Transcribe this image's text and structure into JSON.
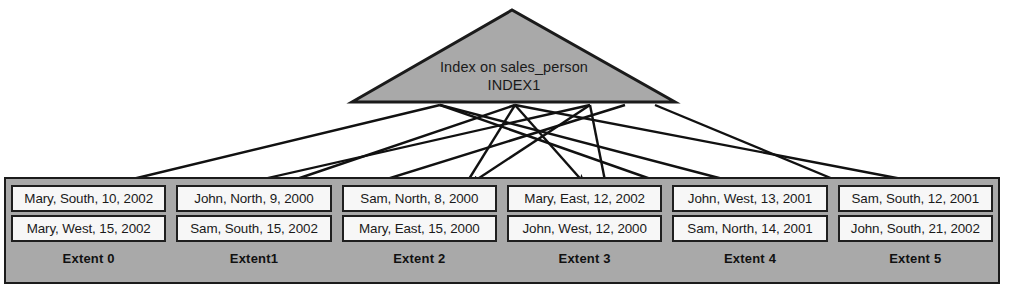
{
  "diagram": {
    "title": "Index on sales_person INDEX1",
    "index_node": {
      "shape": "triangle",
      "line1": "Index on sales_person",
      "line2": "INDEX1",
      "fill_color": "#a9a9a9",
      "stroke_color": "#1b1b1b"
    },
    "colors": {
      "extent_background": "#a9a9a9",
      "row_background": "#f7f7f7",
      "outline": "#1b1b1b",
      "page_background": "#ffffff"
    },
    "extents": [
      {
        "label": "Extent 0",
        "rows": [
          "Mary, South, 10, 2002",
          "Mary, West, 15, 2002"
        ]
      },
      {
        "label": "Extent1",
        "rows": [
          "John, North, 9, 2000",
          "Sam, South, 15, 2002"
        ]
      },
      {
        "label": "Extent 2",
        "rows": [
          "Sam, North, 8, 2000",
          "Mary, East, 15, 2000"
        ]
      },
      {
        "label": "Extent 3",
        "rows": [
          "Mary, East, 12, 2002",
          "John, West, 12, 2000"
        ]
      },
      {
        "label": "Extent 4",
        "rows": [
          "John, West, 13, 2001",
          "Sam, North, 14, 2001"
        ]
      },
      {
        "label": "Extent 5",
        "rows": [
          "Sam, South, 12, 2001",
          "John, South, 21, 2002"
        ]
      }
    ],
    "pointers": [
      {
        "from_x": 440,
        "from_y": 105,
        "to_x": 112,
        "to_y": 184
      },
      {
        "from_x": 515,
        "from_y": 105,
        "to_x": 282,
        "to_y": 184
      },
      {
        "from_x": 590,
        "from_y": 105,
        "to_x": 470,
        "to_y": 184
      },
      {
        "from_x": 515,
        "from_y": 105,
        "to_x": 585,
        "to_y": 184
      },
      {
        "from_x": 440,
        "from_y": 105,
        "to_x": 742,
        "to_y": 184
      },
      {
        "from_x": 515,
        "from_y": 105,
        "to_x": 928,
        "to_y": 184
      },
      {
        "from_x": 590,
        "from_y": 105,
        "to_x": 100,
        "to_y": 216
      },
      {
        "from_x": 625,
        "from_y": 105,
        "to_x": 268,
        "to_y": 216
      },
      {
        "from_x": 515,
        "from_y": 105,
        "to_x": 446,
        "to_y": 216
      },
      {
        "from_x": 590,
        "from_y": 105,
        "to_x": 612,
        "to_y": 216
      },
      {
        "from_x": 440,
        "from_y": 105,
        "to_x": 756,
        "to_y": 216
      },
      {
        "from_x": 655,
        "from_y": 105,
        "to_x": 922,
        "to_y": 216
      }
    ]
  }
}
